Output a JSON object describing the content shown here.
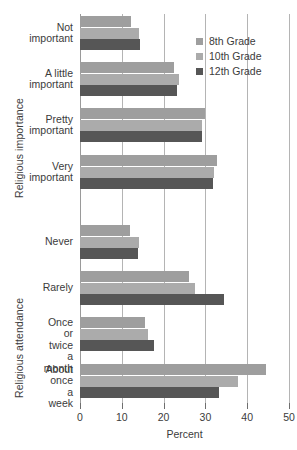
{
  "chart_data": {
    "type": "bar",
    "orientation": "horizontal",
    "title": "",
    "xlabel": "Percent",
    "ylabel": "",
    "xlim": [
      0,
      50
    ],
    "xticks": [
      0,
      10,
      20,
      30,
      40,
      50
    ],
    "grid": true,
    "legend_position": "top-right",
    "legend": [
      "8th Grade",
      "10th Grade",
      "12th Grade"
    ],
    "series": [
      {
        "name": "8th Grade",
        "color": "#9e9e9e",
        "values": [
          12.3,
          22.4,
          30.0,
          32.7,
          12.0,
          26.0,
          15.6,
          44.5
        ]
      },
      {
        "name": "10th Grade",
        "color": "#ababab",
        "values": [
          14.2,
          23.6,
          29.3,
          32.0,
          14.2,
          27.4,
          16.3,
          37.7
        ]
      },
      {
        "name": "12th Grade",
        "color": "#565656",
        "values": [
          14.4,
          23.3,
          29.1,
          31.7,
          13.9,
          34.4,
          17.8,
          33.2
        ]
      }
    ],
    "panels": [
      {
        "axis_title": "Religious importance",
        "categories": [
          "Not\nimportant",
          "A little\nimportant",
          "Pretty\nimportant",
          "Very\nimportant"
        ]
      },
      {
        "axis_title": "Religious attendance",
        "categories": [
          "Never",
          "Rarely",
          "Once or\ntwice\na month",
          "About\nonce\na week"
        ]
      }
    ],
    "categories": [
      "Not important",
      "A little important",
      "Pretty important",
      "Very important",
      "Never",
      "Rarely",
      "Once or twice a month",
      "About once a week"
    ]
  },
  "axes": {
    "importance_title": "Religious importance",
    "attendance_title": "Religious attendance",
    "x_label": "Percent"
  },
  "legend": {
    "items": [
      {
        "label": "8th Grade",
        "color": "#9e9e9e"
      },
      {
        "label": "10th Grade",
        "color": "#ababab"
      },
      {
        "label": "12th Grade",
        "color": "#565656"
      }
    ]
  },
  "colors": {
    "grade8": "#9e9e9e",
    "grade10": "#ababab",
    "grade12": "#565656",
    "gridline": "#b4b4b4",
    "text": "#3b3b3b",
    "background": "#ffffff"
  }
}
